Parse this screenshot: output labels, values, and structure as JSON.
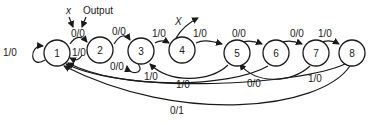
{
  "diagram": {
    "type": "state-transition-diagram",
    "annotations": {
      "input_label": "x",
      "output_label": "Output",
      "exit_label": "X"
    },
    "states": [
      {
        "id": "1",
        "label": "1"
      },
      {
        "id": "2",
        "label": "2"
      },
      {
        "id": "3",
        "label": "3"
      },
      {
        "id": "4",
        "label": "4"
      },
      {
        "id": "5",
        "label": "5"
      },
      {
        "id": "6",
        "label": "6"
      },
      {
        "id": "7",
        "label": "7"
      },
      {
        "id": "8",
        "label": "8"
      }
    ],
    "transitions": [
      {
        "from": "1",
        "to": "1",
        "label": "1/0"
      },
      {
        "from": "1",
        "to": "2",
        "label": "0/0"
      },
      {
        "from": "2",
        "to": "1",
        "label": "1/0"
      },
      {
        "from": "2",
        "to": "3",
        "label": "0/0"
      },
      {
        "from": "3",
        "to": "3",
        "label": "0/0"
      },
      {
        "from": "3",
        "to": "4",
        "label": "1/0"
      },
      {
        "from": "4",
        "to": "5",
        "label": "1/0"
      },
      {
        "from": "5",
        "to": "3",
        "label": "1/0"
      },
      {
        "from": "5",
        "to": "6",
        "label": "0/0"
      },
      {
        "from": "6",
        "to": "1",
        "label": "1/0"
      },
      {
        "from": "6",
        "to": "7",
        "label": "0/0"
      },
      {
        "from": "7",
        "to": "5",
        "label": "0/0"
      },
      {
        "from": "7",
        "to": "8",
        "label": "1/0"
      },
      {
        "from": "8",
        "to": "1",
        "label": "1/0"
      },
      {
        "from": "8",
        "to": "1",
        "label": "0/1"
      }
    ]
  }
}
